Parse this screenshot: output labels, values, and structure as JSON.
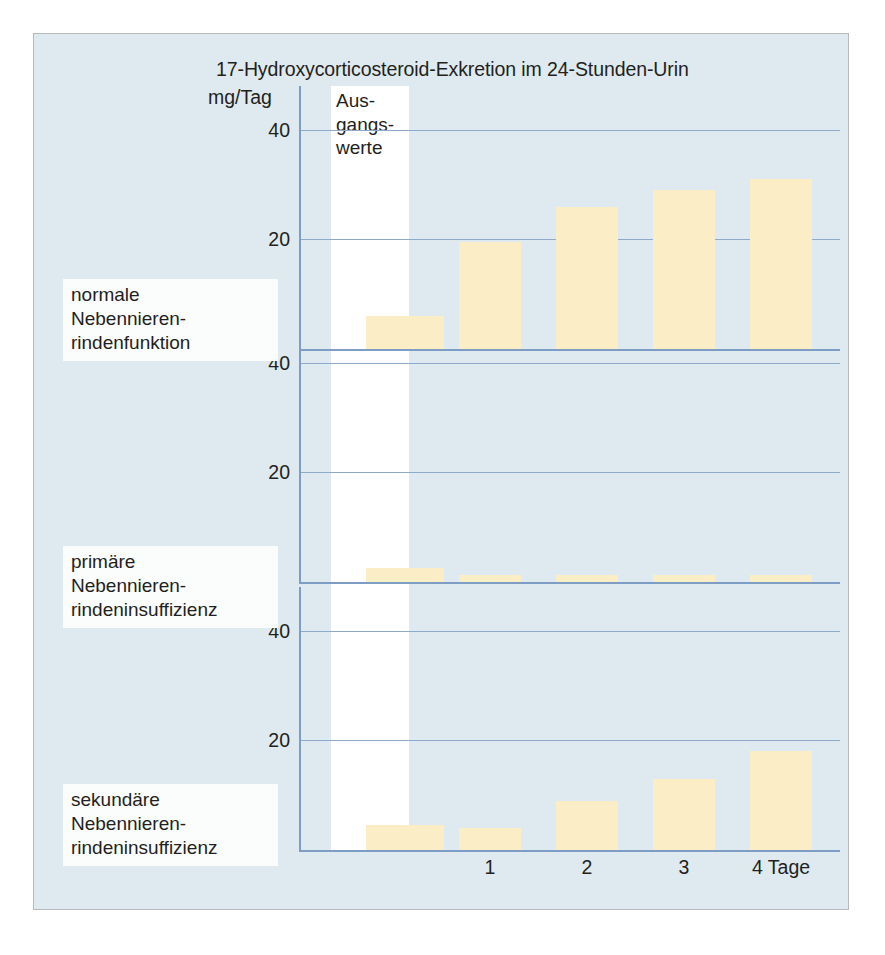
{
  "figure": {
    "title": "17-Hydroxycorticosteroid-Exkretion im 24-Stunden-Urin",
    "y_axis_unit": "mg/Tag",
    "baseline_label": "Aus-\ngangs-\nwerte",
    "background_color": "#dfeaf0",
    "bar_color": "#fbeec6",
    "grid_color": "#8fa9c9",
    "axis_color": "#7e9dc4"
  },
  "panels": [
    {
      "caption": "normale\nNebennieren-\nrindenfunktion",
      "baseline_value": 6,
      "values": [
        19.5,
        26,
        29,
        31
      ]
    },
    {
      "caption": "primäre\nNebennieren-\nrindeninsuffizienz",
      "baseline_value": 2.5,
      "values": [
        1.2,
        1.2,
        1.3,
        1.3
      ]
    },
    {
      "caption": "sekundäre\nNebennieren-\nrindeninsuffizienz",
      "baseline_value": 4.5,
      "values": [
        4,
        9,
        13,
        18
      ]
    }
  ],
  "x_axis": {
    "labels": [
      "1",
      "2",
      "3",
      "4 Tage"
    ]
  },
  "y_axis": {
    "ticks": [
      20,
      40
    ],
    "max": 48
  },
  "chart_data": {
    "type": "bar",
    "title": "17-Hydroxycorticosteroid-Exkretion im 24-Stunden-Urin",
    "xlabel": "Tage",
    "ylabel": "mg/Tag",
    "ylim": [
      0,
      48
    ],
    "yticks": [
      20,
      40
    ],
    "categories": [
      "Ausgangswerte",
      "1",
      "2",
      "3",
      "4 Tage"
    ],
    "grid": true,
    "legend": "none",
    "series": [
      {
        "name": "normale Nebennierenrindenfunktion",
        "values": [
          6,
          19.5,
          26,
          29,
          31
        ]
      },
      {
        "name": "primäre Nebennierenrindeninsuffizienz",
        "values": [
          2.5,
          1.2,
          1.2,
          1.3,
          1.3
        ]
      },
      {
        "name": "sekundäre Nebennierenrindeninsuffizienz",
        "values": [
          4.5,
          4,
          9,
          13,
          18
        ]
      }
    ],
    "annotations": [
      "Ausgangswerte"
    ]
  }
}
